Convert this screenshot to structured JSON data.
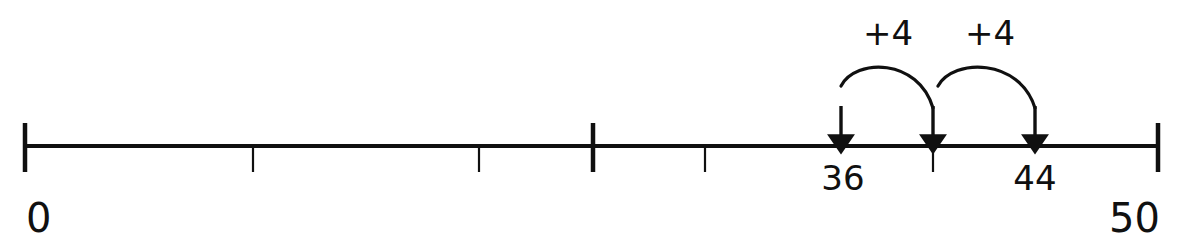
{
  "diagram": {
    "kind": "number-line",
    "line_color": "#101010",
    "text_color": "#101010",
    "background_color": "#ffffff",
    "axis": {
      "start_value": 0,
      "end_value": 50,
      "start_label": "0",
      "end_label": "50"
    },
    "endpoints": [
      {
        "name": "start",
        "label": "0",
        "value": 0,
        "x": 25,
        "label_x": 26,
        "label_y": 232
      },
      {
        "name": "end",
        "label": "50",
        "value": 50,
        "x": 1158,
        "label_x": 1160,
        "label_y": 232
      }
    ],
    "major_ticks": [
      {
        "x": 25,
        "value": 0
      },
      {
        "x": 593,
        "value": 25
      },
      {
        "x": 1158,
        "value": 50
      }
    ],
    "minor_ticks": [
      {
        "x": 253,
        "value": 10
      },
      {
        "x": 479,
        "value": 20
      },
      {
        "x": 705,
        "value": 30
      },
      {
        "x": 933,
        "value": 40
      }
    ],
    "markers": [
      {
        "name": "marker-36",
        "value": 36,
        "label": "36",
        "x": 841,
        "label_x": 843,
        "label_y": 190,
        "has_label": true
      },
      {
        "name": "marker-40",
        "value": 40,
        "label": "",
        "x": 933,
        "label_x": 933,
        "label_y": 190,
        "has_label": false
      },
      {
        "name": "marker-44",
        "value": 44,
        "label": "44",
        "x": 1035,
        "label_x": 1035,
        "label_y": 190,
        "has_label": true
      }
    ],
    "arrows": [
      {
        "name": "arrow-to-36",
        "x": 841,
        "tip_y": 146,
        "tail_y": 106
      },
      {
        "name": "arrow-to-40",
        "x": 933,
        "tip_y": 146,
        "tail_y": 106
      },
      {
        "name": "arrow-to-44",
        "x": 1035,
        "tip_y": 146,
        "tail_y": 106
      }
    ],
    "hops": [
      {
        "name": "hop-1",
        "label": "+4",
        "amount": 4,
        "from_value": 36,
        "to_value": 40,
        "from_x": 841,
        "to_x": 933,
        "peak_y": 66,
        "label_x": 888,
        "label_y": 45
      },
      {
        "name": "hop-2",
        "label": "+4",
        "amount": 4,
        "from_value": 40,
        "to_value": 44,
        "from_x": 938,
        "to_x": 1035,
        "peak_y": 66,
        "label_x": 990,
        "label_y": 45
      }
    ],
    "geometry": {
      "baseline_y": 146,
      "line_x_start": 25,
      "line_x_end": 1158,
      "major_tick_top": 123,
      "major_tick_bottom": 172,
      "minor_tick_bottom": 172
    }
  },
  "chart_data": {
    "type": "line",
    "xlabel": "",
    "ylabel": "",
    "xlim": [
      0,
      50
    ],
    "grid": false,
    "legend": "none",
    "tick_labels": [
      "0",
      "50"
    ],
    "labeled_points": [
      {
        "value": 36,
        "label": "36"
      },
      {
        "value": 44,
        "label": "44"
      }
    ],
    "annotations": [
      "+4",
      "+4"
    ],
    "jumps": [
      {
        "from": 36,
        "to": 40,
        "delta": 4,
        "label": "+4"
      },
      {
        "from": 40,
        "to": 44,
        "delta": 4,
        "label": "+4"
      }
    ]
  }
}
